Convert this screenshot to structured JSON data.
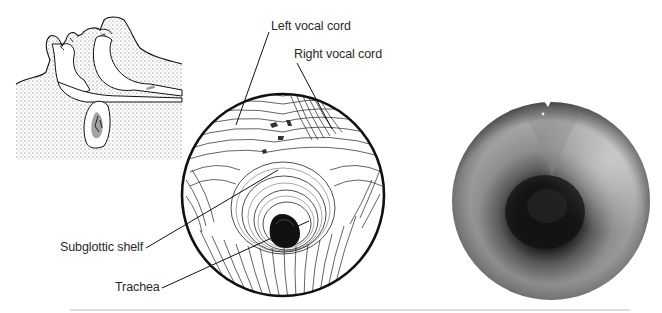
{
  "figure": {
    "panels": [
      {
        "id": "sagittal-sketch",
        "description": "Sagittal line drawing of infant head and neck, stippled"
      },
      {
        "id": "endoscopic-drawing",
        "description": "Line drawing of laryngoscopic view of the larynx and trachea"
      },
      {
        "id": "endoscopic-photo",
        "description": "Grayscale endoscopic photograph of the subglottis and trachea"
      }
    ],
    "labels": {
      "left_vocal_cord": "Left vocal cord",
      "right_vocal_cord": "Right vocal cord",
      "subglottic_shelf": "Subglottic shelf",
      "trachea": "Trachea"
    },
    "colors": {
      "ink": "#111111",
      "stipple": "#555555",
      "photo_light": "#b9b9b9",
      "photo_dark": "#161616"
    }
  }
}
